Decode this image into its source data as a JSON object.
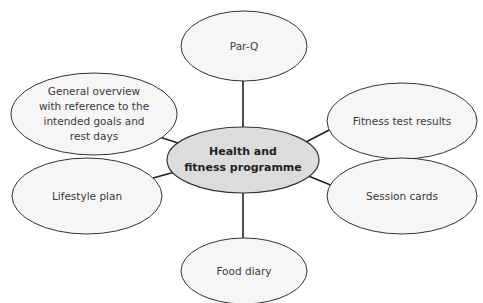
{
  "diagram": {
    "type": "mind-map",
    "colors": {
      "center_fill": "#dcdcdc",
      "node_fill": "#f6f6f6",
      "stroke": "#333333",
      "connector": "#222222",
      "text": "#3a3a3a"
    },
    "center": {
      "label_line1": "Health and",
      "label_line2": "fitness programme",
      "cx": 243,
      "cy": 160,
      "rx": 76,
      "ry": 33
    },
    "nodes": [
      {
        "id": "parq",
        "lines": [
          "Par-Q"
        ],
        "cx": 244,
        "cy": 46,
        "rx": 63,
        "ry": 35
      },
      {
        "id": "general-overview",
        "lines": [
          "General overview",
          "with reference to the",
          "intended goals and",
          "rest days"
        ],
        "cx": 94,
        "cy": 114,
        "rx": 83,
        "ry": 41
      },
      {
        "id": "fitness-test-results",
        "lines": [
          "Fitness test results"
        ],
        "cx": 402,
        "cy": 121,
        "rx": 75,
        "ry": 38
      },
      {
        "id": "lifestyle-plan",
        "lines": [
          "Lifestyle plan"
        ],
        "cx": 87,
        "cy": 196,
        "rx": 75,
        "ry": 38
      },
      {
        "id": "session-cards",
        "lines": [
          "Session cards"
        ],
        "cx": 402,
        "cy": 196,
        "rx": 75,
        "ry": 38
      },
      {
        "id": "food-diary",
        "lines": [
          "Food diary"
        ],
        "cx": 244,
        "cy": 271,
        "rx": 63,
        "ry": 33
      }
    ],
    "connectors": [
      {
        "to": "parq",
        "x1": 243,
        "y1": 127,
        "x2": 243,
        "y2": 81
      },
      {
        "to": "general-overview",
        "x1": 178,
        "y1": 143,
        "x2": 147,
        "y2": 133
      },
      {
        "to": "fitness-test-results",
        "x1": 306,
        "y1": 142,
        "x2": 335,
        "y2": 127
      },
      {
        "to": "lifestyle-plan",
        "x1": 175,
        "y1": 172,
        "x2": 153,
        "y2": 178
      },
      {
        "to": "session-cards",
        "x1": 306,
        "y1": 175,
        "x2": 333,
        "y2": 186
      },
      {
        "to": "food-diary",
        "x1": 243,
        "y1": 193,
        "x2": 243,
        "y2": 238
      }
    ]
  }
}
